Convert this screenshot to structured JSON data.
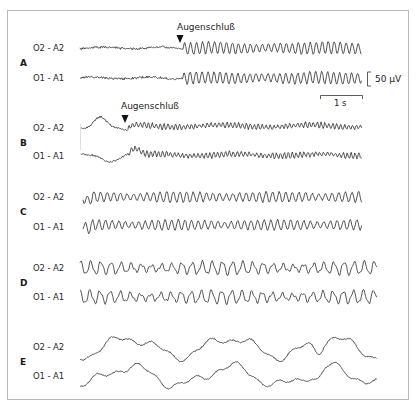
{
  "figure": {
    "annotation_label": "Augenschluß",
    "scale": {
      "voltage_label": "50 µV",
      "time_label": "1 s"
    },
    "colors": {
      "trace": "#2b2b2b",
      "frame": "#b9b9b9",
      "text": "#222222"
    }
  },
  "sections": [
    {
      "id": "A",
      "channels": [
        {
          "label": "O2 - A2",
          "y": 48,
          "x0": 80,
          "x1": 362,
          "style": "alpha_onset",
          "onset": 183,
          "amp": 5,
          "seed": 11
        },
        {
          "label": "O1 - A1",
          "y": 78,
          "x0": 80,
          "x1": 362,
          "style": "alpha_onset",
          "onset": 183,
          "amp": 5,
          "seed": 23
        }
      ],
      "annotation": {
        "text_x": 177,
        "text_y": 22,
        "arrow_x": 180,
        "arrow_y": 35
      }
    },
    {
      "id": "B",
      "channels": [
        {
          "label": "O2 - A2",
          "y": 128,
          "x0": 81,
          "x1": 362,
          "style": "bump_onset",
          "onset": 128,
          "amp": 3,
          "seed": 37
        },
        {
          "label": "O1 - A1",
          "y": 155,
          "x0": 81,
          "x1": 362,
          "style": "dip_onset",
          "onset": 128,
          "amp": 3,
          "seed": 41
        }
      ],
      "annotation": {
        "text_x": 121,
        "text_y": 101,
        "arrow_x": 125,
        "arrow_y": 115
      }
    },
    {
      "id": "C",
      "channels": [
        {
          "label": "O2 - A2",
          "y": 197,
          "x0": 83,
          "x1": 362,
          "style": "alpha",
          "amp": 5,
          "seed": 53
        },
        {
          "label": "O1 - A1",
          "y": 225,
          "x0": 83,
          "x1": 362,
          "style": "alpha",
          "amp": 5,
          "seed": 67
        }
      ]
    },
    {
      "id": "D",
      "channels": [
        {
          "label": "O2 - A2",
          "y": 268,
          "x0": 80,
          "x1": 377,
          "style": "theta",
          "amp": 6,
          "seed": 71
        },
        {
          "label": "O1 - A1",
          "y": 297,
          "x0": 80,
          "x1": 377,
          "style": "theta",
          "amp": 6,
          "seed": 83
        }
      ]
    },
    {
      "id": "E",
      "channels": [
        {
          "label": "O2 - A2",
          "y": 347,
          "x0": 80,
          "x1": 377,
          "style": "delta",
          "amp": 9,
          "seed": 97
        },
        {
          "label": "O1 - A1",
          "y": 376,
          "x0": 80,
          "x1": 377,
          "style": "delta",
          "amp": 9,
          "seed": 101
        }
      ]
    }
  ]
}
